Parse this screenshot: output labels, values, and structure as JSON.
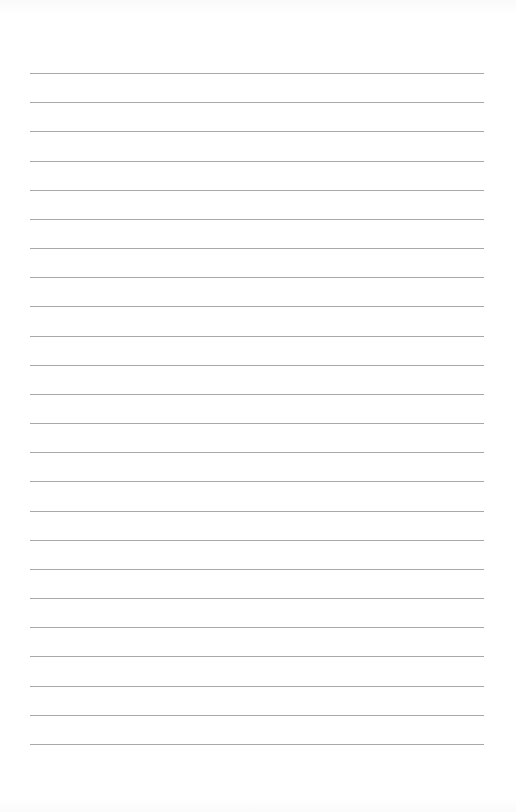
{
  "page": {
    "type": "lined-paper",
    "background_color": "#ffffff",
    "line_color": "#a8a8a8",
    "line_count": 24,
    "first_line_y": 73,
    "line_spacing": 29.17,
    "line_left": 30,
    "line_width": 454
  }
}
